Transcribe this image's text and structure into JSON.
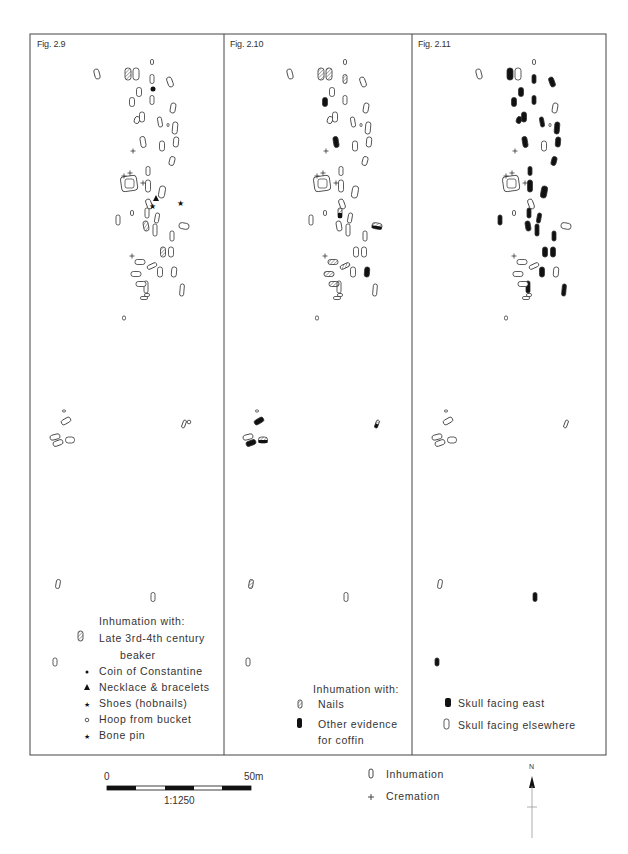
{
  "panels": [
    {
      "title": "Fig. 2.9",
      "legend_heading": "Inhumation with:",
      "legend": [
        {
          "icon": "hatched-grave-icon",
          "label": "Late 3rd-4th century",
          "label2": "beaker"
        },
        {
          "icon": "dot-icon",
          "label": "Coin of Constantine"
        },
        {
          "icon": "triangle-icon",
          "label": "Necklace & bracelets"
        },
        {
          "icon": "star-icon",
          "label": "Shoes (hobnails)"
        },
        {
          "icon": "circle-icon",
          "label": "Hoop from bucket"
        },
        {
          "icon": "star-icon",
          "label": "Bone pin"
        }
      ]
    },
    {
      "title": "Fig. 2.10",
      "legend_heading": "Inhumation with:",
      "legend": [
        {
          "icon": "hatched-grave-icon",
          "label": "Nails"
        },
        {
          "icon": "black-grave-icon",
          "label": "Other evidence",
          "label2": "for coffin"
        }
      ]
    },
    {
      "title": "Fig. 2.11",
      "legend": [
        {
          "icon": "black-grave-icon",
          "label": "Skull facing east"
        },
        {
          "icon": "outline-grave-icon",
          "label": "Skull facing elsewhere"
        }
      ]
    }
  ],
  "scale_bar": {
    "start": "0",
    "end": "50m",
    "ratio": "1:1250"
  },
  "key": [
    {
      "icon": "inhumation-icon",
      "label": "Inhumation"
    },
    {
      "icon": "cremation-icon",
      "label": "Cremation"
    }
  ],
  "north_arrow": {
    "label": "N"
  },
  "colors": {
    "line": "#333333",
    "fill": "#111111",
    "hatch": "#555555"
  }
}
